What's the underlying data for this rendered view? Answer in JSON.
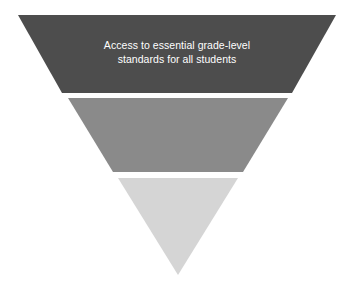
{
  "diagram": {
    "type": "inverted-funnel",
    "title": "",
    "background_color": "#ffffff",
    "canvas": {
      "width": 354,
      "height": 296
    },
    "bands": [
      {
        "id": "band-1",
        "label": "Access to essential grade-level\nstandards for all students",
        "label_line_1": "Access to essential grade-level",
        "label_line_2": "standards for all students",
        "color": "#4d4d4d",
        "text_color": "#ffffff",
        "points": "18,15 336,15 292,93 62,93"
      },
      {
        "id": "band-2",
        "label": "",
        "color": "#8a8a8a",
        "text_color": "#ffffff",
        "points": "68,98 288,98 243,172 113,172"
      },
      {
        "id": "band-3",
        "label": "",
        "color": "#d5d5d5",
        "text_color": "#4d4d4d",
        "points": "118,178 238,178 178,275"
      }
    ]
  }
}
